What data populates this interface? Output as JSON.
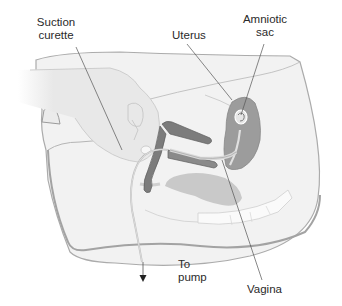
{
  "diagram": {
    "labels": {
      "suction_curette": "Suction curette",
      "uterus": "Uterus",
      "amniotic_sac": "Amniotic sac",
      "to_pump": "To pump",
      "vagina": "Vagina"
    },
    "label_lines": {
      "suction_curette": [
        "Suction",
        "curette"
      ],
      "amniotic_sac": [
        "Amniotic",
        "sac"
      ],
      "to_pump": [
        "To",
        "pump"
      ]
    },
    "colors": {
      "background": "#ffffff",
      "body_fill": "#f1f1f1",
      "body_outline": "#a9a9a9",
      "hand_fill": "#e9e9e9",
      "organ_fill": "#9a9a9a",
      "instrument_fill": "#7d7d7d",
      "leader_line": "#555555",
      "text": "#2a2a2a"
    }
  }
}
